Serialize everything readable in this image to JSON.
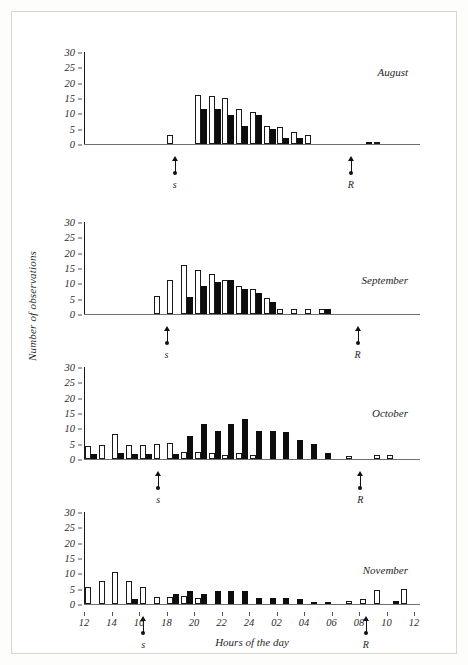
{
  "figure": {
    "ylabel": "Number of observations",
    "xlabel": "Hours of the day"
  },
  "chart_data": {
    "type": "bar",
    "title": "",
    "xlabel": "Hours of the day",
    "ylabel": "Number of observations",
    "ylim": [
      0,
      30
    ],
    "yticks": [
      0,
      5,
      10,
      15,
      20,
      25,
      30
    ],
    "xlim": [
      12,
      36
    ],
    "xtick_values": [
      12,
      14,
      16,
      18,
      20,
      22,
      24,
      26,
      28,
      30,
      32,
      34,
      36
    ],
    "xtick_labels": [
      "12",
      "14",
      "16",
      "18",
      "20",
      "22",
      "24",
      "02",
      "04",
      "06",
      "08",
      "10",
      "12"
    ],
    "grid": false,
    "legend": "none",
    "bar_styles": {
      "open": "white bar with black outline",
      "filled": "solid black bar"
    },
    "x": [
      12,
      13,
      14,
      15,
      16,
      17,
      18,
      19,
      20,
      21,
      22,
      23,
      24,
      25,
      26,
      27,
      28,
      29,
      30,
      31,
      32,
      33,
      34,
      35
    ],
    "panels": [
      {
        "label": "August",
        "sunset_hour": 18.6,
        "sunrise_hour": 31.4,
        "sunset_label": "s",
        "sunrise_label": "R",
        "series": [
          {
            "name": "open",
            "values": [
              0,
              0,
              0,
              0,
              0,
              0,
              3,
              0,
              16,
              15.5,
              15,
              11.5,
              10.5,
              6,
              5.5,
              4,
              3,
              0,
              0,
              0,
              0,
              0.7,
              0,
              0
            ]
          },
          {
            "name": "filled",
            "values": [
              0,
              0,
              0,
              0,
              0,
              0,
              0,
              0,
              11.5,
              11.3,
              9.5,
              5.8,
              9.5,
              5,
              2,
              1.8,
              0,
              0,
              0,
              0,
              0.6,
              0,
              0,
              0
            ]
          }
        ]
      },
      {
        "label": "September",
        "sunset_hour": 18.0,
        "sunrise_hour": 31.9,
        "sunset_label": "s",
        "sunrise_label": "R",
        "series": [
          {
            "name": "open",
            "values": [
              0,
              0,
              0,
              0,
              0,
              6,
              11,
              16,
              14.5,
              13,
              11,
              9,
              8,
              5.2,
              1.6,
              1.6,
              1.6,
              1.6,
              0,
              0,
              0,
              0,
              0,
              0
            ]
          },
          {
            "name": "filled",
            "values": [
              0,
              0,
              0,
              0,
              0,
              0,
              0,
              5.5,
              9.2,
              10.4,
              11,
              8,
              7,
              3.8,
              0,
              0,
              0,
              1.6,
              0,
              0,
              0,
              0,
              0,
              0
            ]
          }
        ]
      },
      {
        "label": "October",
        "sunset_hour": 17.4,
        "sunrise_hour": 32.1,
        "sunset_label": "s",
        "sunrise_label": "R",
        "series": [
          {
            "name": "open",
            "values": [
              4.3,
              4.5,
              8,
              4.7,
              4.7,
              5,
              5.1,
              2.3,
              2.3,
              1.9,
              1.3,
              1.8,
              1.2,
              0,
              0,
              0,
              0,
              0,
              0,
              0.9,
              0,
              1.2,
              1.2,
              0
            ]
          },
          {
            "name": "filled",
            "values": [
              1.5,
              0,
              1.8,
              1.5,
              1.5,
              0,
              1.5,
              7.5,
              11.5,
              9,
              11.5,
              13,
              9,
              9,
              8.8,
              6.2,
              5,
              2.1,
              0,
              0,
              0,
              0,
              0,
              0
            ]
          }
        ]
      },
      {
        "label": "November",
        "sunset_hour": 16.3,
        "sunrise_hour": 32.5,
        "sunset_label": "s",
        "sunrise_label": "R",
        "series": [
          {
            "name": "open",
            "values": [
              5.5,
              7.5,
              10.6,
              7.5,
              5.7,
              2.4,
              2.2,
              2.6,
              2,
              0,
              0,
              0,
              0,
              0,
              0,
              0,
              0,
              0,
              0,
              0.9,
              1.6,
              4.7,
              0,
              5
            ]
          },
          {
            "name": "filled",
            "values": [
              0,
              0,
              0,
              1.5,
              0,
              0,
              3.4,
              4.2,
              3.4,
              4.4,
              4.4,
              4.4,
              2.1,
              1.8,
              1.9,
              1.7,
              0.7,
              0.8,
              0,
              0,
              0,
              0,
              1,
              0
            ]
          }
        ]
      }
    ]
  }
}
